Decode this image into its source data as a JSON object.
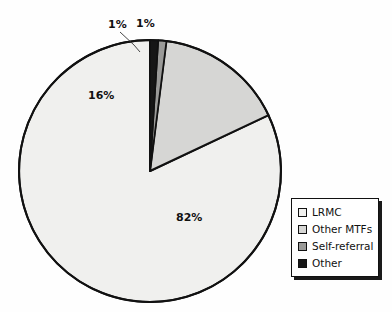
{
  "chart_data": {
    "type": "pie",
    "title": "",
    "categories": [
      "LRMC",
      "Other MTFs",
      "Self-referral",
      "Other"
    ],
    "values": [
      82,
      16,
      1,
      1
    ],
    "value_labels": [
      "82%",
      "16%",
      "1%",
      "1%"
    ],
    "units": "percent",
    "legend_position": "right",
    "grid": false,
    "slice_colors": [
      "#f0f0ee",
      "#d6d6d4",
      "#9a9a98",
      "#161616"
    ],
    "outline_color": "#111111",
    "start_angle_deg": 0,
    "direction": "clockwise",
    "has_leader_line": true
  },
  "labels": {
    "lrmc": "82%",
    "other_mtfs": "16%",
    "self_referral": "1%",
    "other": "1%"
  },
  "legend": {
    "items": [
      {
        "label": "LRMC",
        "color": "#f0f0ee"
      },
      {
        "label": "Other MTFs",
        "color": "#d6d6d4"
      },
      {
        "label": "Self-referral",
        "color": "#9a9a98"
      },
      {
        "label": "Other",
        "color": "#161616"
      }
    ]
  },
  "colors": {
    "background": "#fefefe",
    "stroke": "#111111",
    "text": "#111111"
  }
}
